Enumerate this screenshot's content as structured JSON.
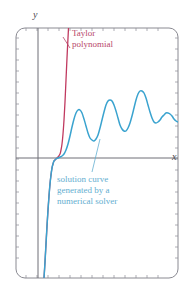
{
  "figure": {
    "title": "",
    "background_color": "#ffffff",
    "frame": {
      "name": "plot-frame",
      "stroke": "#8a8a92",
      "x": 16,
      "y": 28,
      "width": 162,
      "height": 250,
      "corner_radius": 9
    },
    "axes": {
      "x_axis": {
        "label": "x",
        "y_pixel": 158,
        "stroke": "#6e6e76"
      },
      "y_axis": {
        "label": "y",
        "x_pixel": 38,
        "stroke": "#6e6e76"
      }
    },
    "ticks": {
      "spacing_px": 11,
      "length_px": 3,
      "stroke": "#9a9aa2"
    }
  },
  "annotations": [
    {
      "name": "taylor-polynomial-label",
      "text": "Taylor\npolynomial",
      "color": "#b8486a",
      "x": 72,
      "y": 28,
      "leader": {
        "from_x": 70,
        "from_y": 48,
        "to_x": 63,
        "to_y": 37
      }
    },
    {
      "name": "solution-curve-label",
      "text": "solution curve\ngenerated by a\nnumerical solver",
      "color": "#63aed0",
      "x": 57,
      "y": 174,
      "leader": {
        "from_x": 92,
        "from_y": 172,
        "to_x": 100,
        "to_y": 139
      }
    }
  ],
  "chart_data": {
    "type": "line",
    "title": "",
    "xlabel": "x",
    "ylabel": "y",
    "grid": false,
    "legend_position": "inline-annotations",
    "xlim": [
      16,
      178
    ],
    "ylim": [
      278,
      28
    ],
    "series": [
      {
        "name": "Taylor polynomial",
        "color": "#c0395f",
        "linewidth": 1.3,
        "description": "Steeply rising polynomial approximation that blows up just right of the origin",
        "points": [
          [
            44,
            278
          ],
          [
            45,
            262
          ],
          [
            46,
            244
          ],
          [
            47,
            226
          ],
          [
            48,
            210
          ],
          [
            49,
            196
          ],
          [
            50,
            184
          ],
          [
            51,
            175
          ],
          [
            52,
            168
          ],
          [
            53,
            164
          ],
          [
            54,
            161
          ],
          [
            56,
            159
          ],
          [
            58,
            157
          ],
          [
            60,
            154
          ],
          [
            61,
            150
          ],
          [
            62,
            144
          ],
          [
            63,
            134
          ],
          [
            64,
            120
          ],
          [
            65,
            102
          ],
          [
            66,
            80
          ],
          [
            67,
            58
          ],
          [
            68,
            38
          ],
          [
            68.5,
            28
          ]
        ]
      },
      {
        "name": "solution curve generated by a numerical solver",
        "color": "#3aa3cf",
        "linewidth": 1.5,
        "description": "Numerical solution that follows the Taylor curve near the origin then oscillates with growing amplitude",
        "points": [
          [
            44,
            278
          ],
          [
            45,
            262
          ],
          [
            46,
            244
          ],
          [
            47,
            226
          ],
          [
            48,
            210
          ],
          [
            49,
            196
          ],
          [
            50,
            184
          ],
          [
            51,
            175
          ],
          [
            52,
            168
          ],
          [
            53,
            164
          ],
          [
            54,
            161
          ],
          [
            56,
            159
          ],
          [
            58,
            158
          ],
          [
            60,
            157
          ],
          [
            62,
            156
          ],
          [
            64,
            154
          ],
          [
            66,
            150
          ],
          [
            68,
            144
          ],
          [
            70,
            136
          ],
          [
            72,
            127
          ],
          [
            74,
            119
          ],
          [
            76,
            113
          ],
          [
            78,
            110
          ],
          [
            80,
            110
          ],
          [
            82,
            113
          ],
          [
            84,
            119
          ],
          [
            86,
            126
          ],
          [
            88,
            133
          ],
          [
            90,
            138
          ],
          [
            92,
            140
          ],
          [
            94,
            141
          ],
          [
            96,
            139
          ],
          [
            98,
            135
          ],
          [
            100,
            128
          ],
          [
            102,
            120
          ],
          [
            104,
            112
          ],
          [
            106,
            105
          ],
          [
            108,
            101
          ],
          [
            110,
            100
          ],
          [
            112,
            101
          ],
          [
            114,
            105
          ],
          [
            116,
            111
          ],
          [
            118,
            118
          ],
          [
            120,
            125
          ],
          [
            122,
            129
          ],
          [
            124,
            131
          ],
          [
            126,
            131
          ],
          [
            128,
            128
          ],
          [
            130,
            123
          ],
          [
            132,
            116
          ],
          [
            134,
            108
          ],
          [
            136,
            100
          ],
          [
            138,
            94
          ],
          [
            140,
            91
          ],
          [
            142,
            91
          ],
          [
            144,
            93
          ],
          [
            146,
            98
          ],
          [
            148,
            105
          ],
          [
            150,
            112
          ],
          [
            152,
            118
          ],
          [
            154,
            122
          ],
          [
            156,
            123
          ],
          [
            158,
            122
          ],
          [
            160,
            120
          ],
          [
            162,
            117
          ],
          [
            164,
            115
          ],
          [
            166,
            113
          ],
          [
            168,
            113
          ],
          [
            170,
            114
          ],
          [
            172,
            116
          ],
          [
            174,
            119
          ],
          [
            176,
            121
          ],
          [
            178,
            122
          ]
        ],
        "peaks": [
          [
            79,
            110
          ],
          [
            110,
            100
          ],
          [
            141,
            91
          ],
          [
            169,
            113
          ]
        ],
        "troughs": [
          [
            94,
            141
          ],
          [
            126,
            131
          ],
          [
            156,
            123
          ]
        ]
      }
    ]
  }
}
